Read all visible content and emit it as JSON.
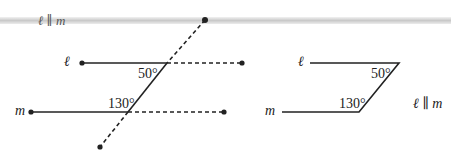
{
  "banner": {
    "label": "ℓ ∥ m"
  },
  "left_figure": {
    "line_l_label": "ℓ",
    "line_m_label": "m",
    "angle_top": "50°",
    "angle_bottom": "130°"
  },
  "right_figure": {
    "line_l_label": "ℓ",
    "line_m_label": "m",
    "angle_top": "50°",
    "angle_bottom": "130°",
    "parallel_note": "ℓ ∥ m"
  },
  "colors": {
    "stroke": "#222222",
    "bar": "#cccccc"
  }
}
